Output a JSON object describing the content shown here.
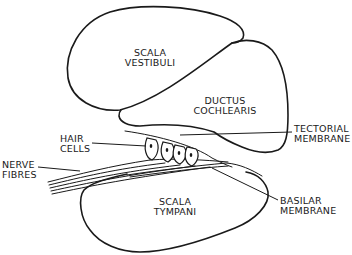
{
  "diagram": {
    "line_color": "#1a1a1a",
    "background": "#ffffff",
    "regions": [
      {
        "id": "scala-vestibuli",
        "line1": "SCALA",
        "line2": "VESTIBULI"
      },
      {
        "id": "ductus-cochlearis",
        "line1": "DUCTUS",
        "line2": "COCHLEARIS"
      },
      {
        "id": "scala-tympani",
        "line1": "SCALA",
        "line2": "TYMPANI"
      }
    ],
    "callouts": [
      {
        "id": "hair-cells",
        "line1": "HAIR",
        "line2": "CELLS"
      },
      {
        "id": "nerve-fibres",
        "line1": "NERVE",
        "line2": "FIBRES"
      },
      {
        "id": "tectorial-membrane",
        "line1": "TECTORIAL",
        "line2": "MEMBRANE"
      },
      {
        "id": "basilar-membrane",
        "line1": "BASILAR",
        "line2": "MEMBRANE"
      }
    ],
    "hair_cell_count": 4
  }
}
